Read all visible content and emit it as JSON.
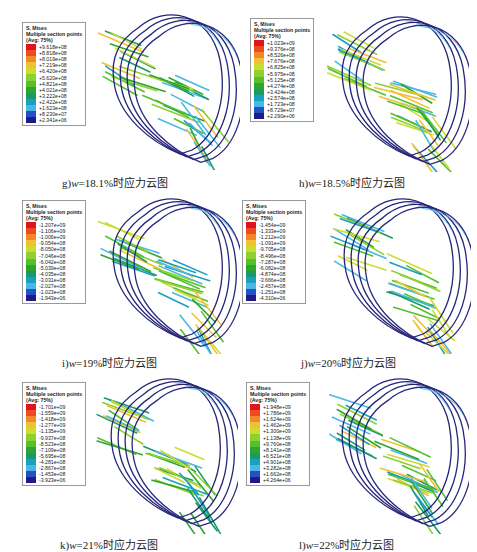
{
  "legend_header": {
    "line1": "S, Mises",
    "line2": "Multiple section points",
    "line3": "(Avg: 75%)"
  },
  "colormap": [
    "#e0141c",
    "#ee4a1e",
    "#f4862a",
    "#f1c033",
    "#cddc2f",
    "#8cd12e",
    "#54c02f",
    "#2ea52e",
    "#1a9a6a",
    "#1aa0c0",
    "#49b8e4",
    "#2450c8",
    "#1e1a86"
  ],
  "panels": [
    {
      "id": "g",
      "caption_prefix": "g)",
      "caption_var": "w",
      "caption_rest": "=18.1%时应力云图",
      "legend_values": [
        "+9.618e+08",
        "+8.818e+08",
        "+8.019e+08",
        "+7.219e+08",
        "+6.420e+08",
        "+5.620e+08",
        "+4.821e+08",
        "+4.021e+08",
        "+3.222e+08",
        "+2.422e+08",
        "+1.623e+08",
        "+8.230e+07",
        "+2.341e+06"
      ]
    },
    {
      "id": "h",
      "caption_prefix": "h)",
      "caption_var": "w",
      "caption_rest": "=18.5%时应力云图",
      "legend_values": [
        "+1.023e+09",
        "+9.376e+08",
        "+8.526e+08",
        "+7.676e+08",
        "+6.825e+08",
        "+5.975e+08",
        "+5.125e+08",
        "+4.274e+08",
        "+3.424e+08",
        "+2.574e+08",
        "+1.723e+08",
        "+8.729e+07",
        "+2.290e+06"
      ]
    },
    {
      "id": "i",
      "caption_prefix": "i)",
      "caption_var": "w",
      "caption_rest": "=19%时应力云图",
      "legend_values": [
        "-1.207e+09",
        "-1.106e+09",
        "-1.006e+09",
        "-9.054e+08",
        "-8.050e+08",
        "-7.046e+08",
        "-6.042e+08",
        "-5.039e+08",
        "-4.035e+08",
        "-3.031e+08",
        "-2.027e+08",
        "-1.023e+08",
        "-1.943e+06"
      ]
    },
    {
      "id": "j",
      "caption_prefix": "j)",
      "caption_var": "w",
      "caption_rest": "=20%时应力云图",
      "legend_values": [
        "-1.454e+09",
        "-1.333e+09",
        "-1.212e+09",
        "-1.091e+09",
        "-9.705e+08",
        "-8.496e+08",
        "-7.287e+08",
        "-6.082e+08",
        "-4.874e+08",
        "-3.666e+08",
        "-2.457e+08",
        "-1.251e+08",
        "-4.310e+06"
      ]
    },
    {
      "id": "k",
      "caption_prefix": "k)",
      "caption_var": "w",
      "caption_rest": "=21%时应力云图",
      "legend_values": [
        "-1.701e+09",
        "-1.559e+09",
        "-1.418e+09",
        "-1.277e+09",
        "-1.135e+09",
        "-9.937e+08",
        "-8.523e+08",
        "-7.109e+08",
        "-5.695e+08",
        "-4.281e+08",
        "-2.867e+08",
        "-1.453e+08",
        "-3.923e+06"
      ]
    },
    {
      "id": "l",
      "caption_prefix": "l)",
      "caption_var": "w",
      "caption_rest": "=22%时应力云图",
      "legend_values": [
        "+1.948e+09",
        "+1.786e+09",
        "+1.624e+09",
        "+1.462e+09",
        "+1.300e+09",
        "+1.138e+09",
        "+9.760e+08",
        "+8.141e+08",
        "+6.521e+08",
        "+4.901e+08",
        "+3.282e+08",
        "+1.662e+08",
        "+4.264e+06"
      ]
    }
  ]
}
